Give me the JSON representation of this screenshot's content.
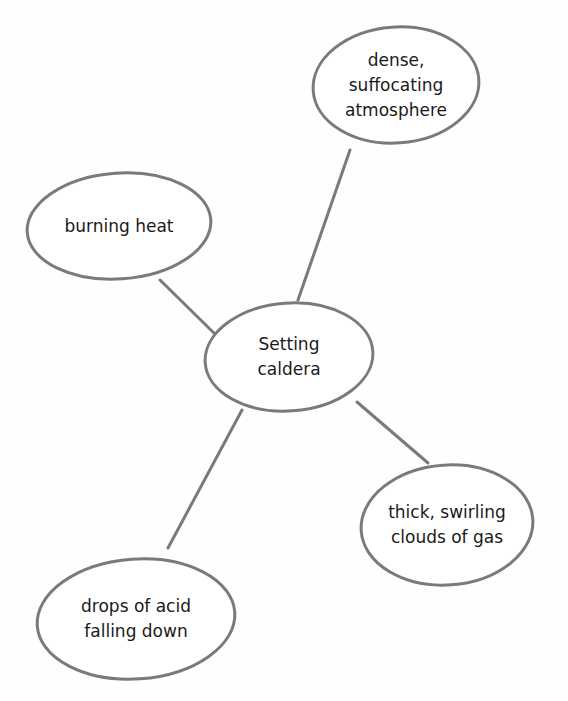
{
  "diagram": {
    "type": "web / concept map",
    "stroke_color": "#7a7a7a",
    "text_color": "#1a1a1a",
    "center": {
      "id": "center",
      "label": "Setting\ncaldera",
      "cx": 289,
      "cy": 357,
      "rx": 84,
      "ry": 54
    },
    "nodes": [
      {
        "id": "atmosphere",
        "label": "dense,\nsuffocating\natmosphere",
        "cx": 396,
        "cy": 85,
        "rx": 83,
        "ry": 58,
        "link": [
          350,
          150,
          298,
          300
        ]
      },
      {
        "id": "heat",
        "label": "burning heat",
        "cx": 119,
        "cy": 226,
        "rx": 92,
        "ry": 53,
        "link": [
          160,
          280,
          216,
          335
        ]
      },
      {
        "id": "gas",
        "label": "thick, swirling\nclouds of gas",
        "cx": 447,
        "cy": 525,
        "rx": 86,
        "ry": 60,
        "link": [
          357,
          402,
          428,
          463
        ]
      },
      {
        "id": "acid",
        "label": "drops of acid\nfalling down",
        "cx": 136,
        "cy": 619,
        "rx": 99,
        "ry": 60,
        "link": [
          242,
          410,
          168,
          548
        ]
      }
    ]
  }
}
